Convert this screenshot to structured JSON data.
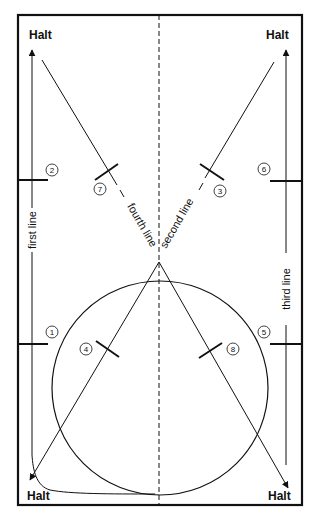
{
  "diagram": {
    "type": "dressage-arena-exercise",
    "colors": {
      "ink": "#111111",
      "background": "#ffffff"
    },
    "halts": {
      "top_left": "Halt",
      "top_right": "Halt",
      "bottom_left": "Halt",
      "bottom_right": "Halt"
    },
    "lines": {
      "first": "first line",
      "second": "second line",
      "third": "third line",
      "fourth": "fourth line"
    },
    "markers": [
      {
        "id": "1",
        "label": "1"
      },
      {
        "id": "2",
        "label": "2"
      },
      {
        "id": "3",
        "label": "3"
      },
      {
        "id": "4",
        "label": "4"
      },
      {
        "id": "5",
        "label": "5"
      },
      {
        "id": "6",
        "label": "6"
      },
      {
        "id": "7",
        "label": "7"
      },
      {
        "id": "8",
        "label": "8"
      }
    ]
  }
}
